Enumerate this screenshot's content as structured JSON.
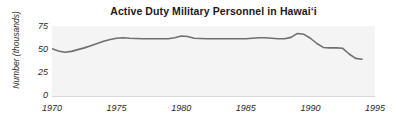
{
  "chart_data": {
    "type": "line",
    "title": "Active Duty Military Personnel in Hawaiʻi",
    "xlabel": "",
    "ylabel": "Number (thousands)",
    "xlim": [
      1970,
      1995
    ],
    "ylim": [
      0,
      80
    ],
    "xticks": [
      "1970",
      "1975",
      "1980",
      "1985",
      "1990",
      "1995"
    ],
    "xtick_values": [
      1970,
      1975,
      1980,
      1985,
      1990,
      1995
    ],
    "yticks": [
      "0",
      "25",
      "50",
      "75"
    ],
    "ytick_values": [
      0,
      25,
      50,
      75
    ],
    "grid": false,
    "legend": false,
    "line_color": "#6f6f6f",
    "plot_background": "#f4f4f4",
    "figure_background": "#ffffff",
    "x": [
      1970,
      1970.5,
      1971,
      1971.5,
      1972,
      1972.5,
      1973,
      1973.5,
      1974,
      1974.5,
      1975,
      1975.5,
      1976,
      1977,
      1978,
      1979,
      1979.5,
      1980,
      1980.5,
      1981,
      1982,
      1983,
      1984,
      1985,
      1986,
      1986.5,
      1987,
      1987.5,
      1988,
      1988.5,
      1989,
      1989.5,
      1990,
      1990.5,
      1991,
      1991.5,
      1992,
      1992.5,
      1993,
      1993.5,
      1994
    ],
    "values": [
      54,
      51.5,
      50,
      51,
      53,
      55,
      57.5,
      60,
      62.5,
      64.5,
      66,
      66.5,
      66,
      65.5,
      65.5,
      65.5,
      66.5,
      68.5,
      68,
      66,
      65.5,
      65.5,
      65.5,
      65.5,
      66.5,
      66.5,
      66,
      65.5,
      65.5,
      67,
      71.5,
      70.5,
      66,
      60,
      55.5,
      55,
      55,
      54.5,
      48,
      43,
      42
    ],
    "series": [
      {
        "name": "Active duty military personnel",
        "values": [
          54,
          51.5,
          50,
          51,
          53,
          55,
          57.5,
          60,
          62.5,
          64.5,
          66,
          66.5,
          66,
          65.5,
          65.5,
          65.5,
          66.5,
          68.5,
          68,
          66,
          65.5,
          65.5,
          65.5,
          65.5,
          66.5,
          66.5,
          66,
          65.5,
          65.5,
          67,
          71.5,
          70.5,
          66,
          60,
          55.5,
          55,
          55,
          54.5,
          48,
          43,
          42
        ]
      }
    ],
    "annotations": []
  }
}
